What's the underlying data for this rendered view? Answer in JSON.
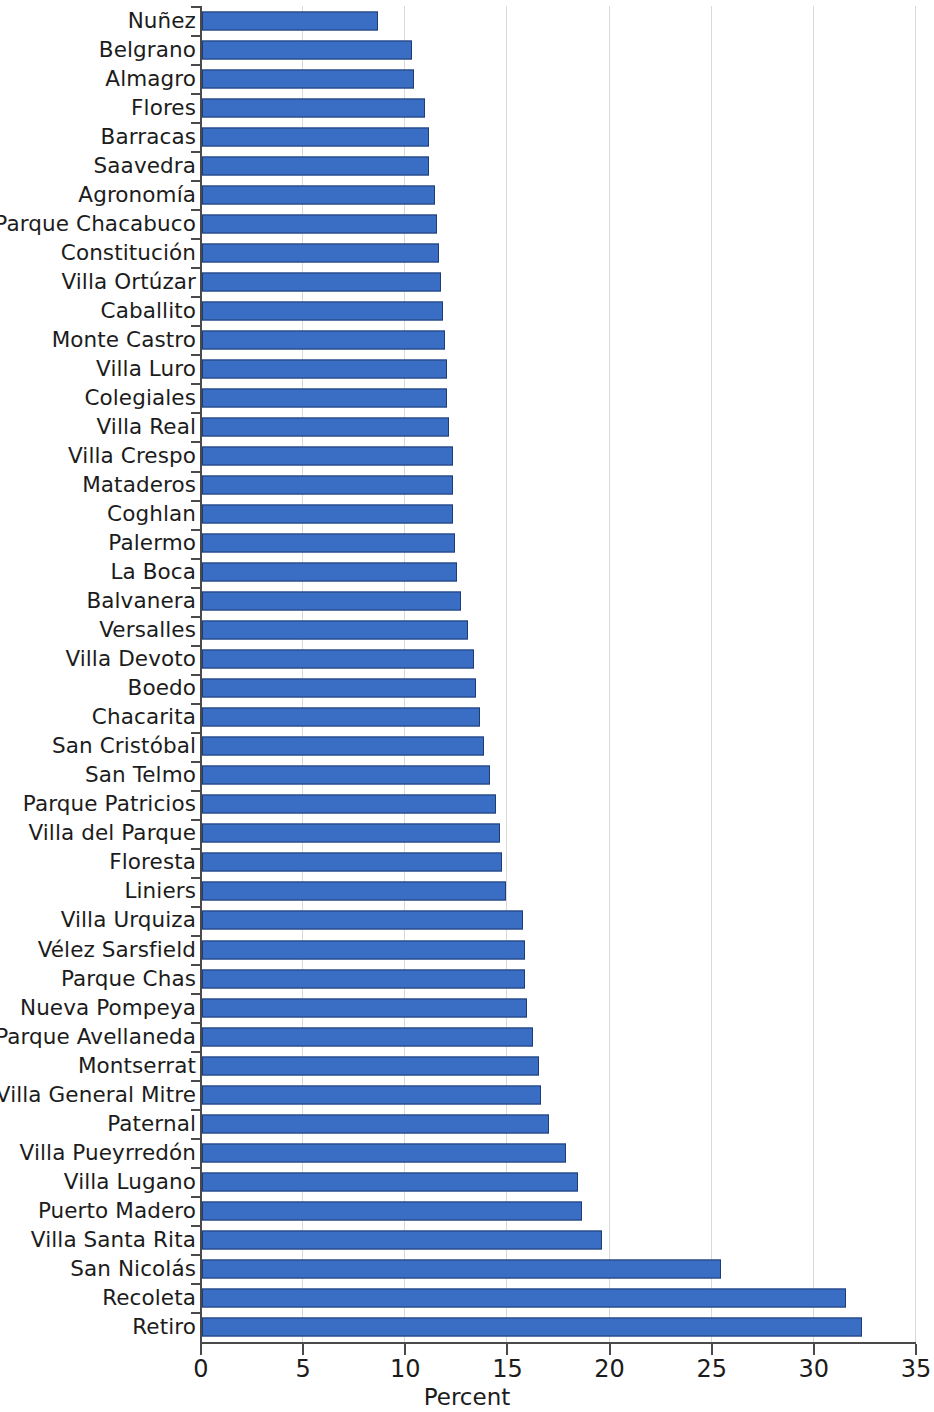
{
  "chart_data": {
    "type": "bar",
    "orientation": "horizontal",
    "title": "",
    "xlabel": "Percent",
    "ylabel": "",
    "xlim": [
      0,
      35
    ],
    "xticks": [
      0,
      5,
      10,
      15,
      20,
      25,
      30,
      35
    ],
    "xtick_labels": [
      "0",
      "5",
      "10",
      "15",
      "20",
      "25",
      "30",
      "35"
    ],
    "grid": true,
    "grid_axis": "x",
    "legend": false,
    "bar_color": "#3a6ec4",
    "bar_edge_color": "#1f3d73",
    "categories": [
      "Nuñez",
      "Belgrano",
      "Almagro",
      "Flores",
      "Barracas",
      "Saavedra",
      "Agronomía",
      "Parque Chacabuco",
      "Constitución",
      "Villa Ortúzar",
      "Caballito",
      "Monte Castro",
      "Villa Luro",
      "Colegiales",
      "Villa Real",
      "Villa Crespo",
      "Mataderos",
      "Coghlan",
      "Palermo",
      "La Boca",
      "Balvanera",
      "Versalles",
      "Villa Devoto",
      "Boedo",
      "Chacarita",
      "San Cristóbal",
      "San Telmo",
      "Parque Patricios",
      "Villa del Parque",
      "Floresta",
      "Liniers",
      "Villa Urquiza",
      "Vélez Sarsfield",
      "Parque Chas",
      "Nueva Pompeya",
      "Parque Avellaneda",
      "Montserrat",
      "Villa General Mitre",
      "Paternal",
      "Villa Pueyrredón",
      "Villa Lugano",
      "Puerto Madero",
      "Villa Santa Rita",
      "San Nicolás",
      "Recoleta",
      "Retiro"
    ],
    "values": [
      8.6,
      10.3,
      10.4,
      10.9,
      11.1,
      11.1,
      11.4,
      11.5,
      11.6,
      11.7,
      11.8,
      11.9,
      12.0,
      12.0,
      12.1,
      12.3,
      12.3,
      12.3,
      12.4,
      12.5,
      12.7,
      13.0,
      13.3,
      13.4,
      13.6,
      13.8,
      14.1,
      14.4,
      14.6,
      14.7,
      14.9,
      15.7,
      15.8,
      15.8,
      15.9,
      16.2,
      16.5,
      16.6,
      17.0,
      17.8,
      18.4,
      18.6,
      19.6,
      25.4,
      31.5,
      32.3
    ]
  }
}
